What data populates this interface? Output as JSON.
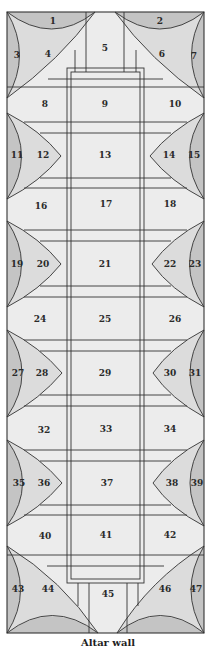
{
  "caption": "Altar wall",
  "colors": {
    "background": "#ececec",
    "light_fill": "#dcdcdc",
    "dark_fill": "#c4c4c4",
    "stroke": "#333333"
  },
  "fields": [
    {
      "n": "1",
      "x": 53,
      "y": 21
    },
    {
      "n": "2",
      "x": 160,
      "y": 21
    },
    {
      "n": "3",
      "x": 17,
      "y": 55
    },
    {
      "n": "4",
      "x": 48,
      "y": 54
    },
    {
      "n": "5",
      "x": 105,
      "y": 48
    },
    {
      "n": "6",
      "x": 162,
      "y": 54
    },
    {
      "n": "7",
      "x": 194,
      "y": 56
    },
    {
      "n": "8",
      "x": 45,
      "y": 104
    },
    {
      "n": "9",
      "x": 105,
      "y": 104
    },
    {
      "n": "10",
      "x": 175,
      "y": 104
    },
    {
      "n": "11",
      "x": 17,
      "y": 155
    },
    {
      "n": "12",
      "x": 43,
      "y": 155
    },
    {
      "n": "13",
      "x": 105,
      "y": 155
    },
    {
      "n": "14",
      "x": 169,
      "y": 155
    },
    {
      "n": "15",
      "x": 194,
      "y": 155
    },
    {
      "n": "16",
      "x": 41,
      "y": 206
    },
    {
      "n": "17",
      "x": 106,
      "y": 204
    },
    {
      "n": "18",
      "x": 170,
      "y": 204
    },
    {
      "n": "19",
      "x": 17,
      "y": 264
    },
    {
      "n": "20",
      "x": 43,
      "y": 264
    },
    {
      "n": "21",
      "x": 105,
      "y": 264
    },
    {
      "n": "22",
      "x": 170,
      "y": 264
    },
    {
      "n": "23",
      "x": 195,
      "y": 264
    },
    {
      "n": "24",
      "x": 40,
      "y": 319
    },
    {
      "n": "25",
      "x": 105,
      "y": 319
    },
    {
      "n": "26",
      "x": 175,
      "y": 319
    },
    {
      "n": "27",
      "x": 18,
      "y": 373
    },
    {
      "n": "28",
      "x": 42,
      "y": 373
    },
    {
      "n": "29",
      "x": 105,
      "y": 373
    },
    {
      "n": "30",
      "x": 170,
      "y": 373
    },
    {
      "n": "31",
      "x": 195,
      "y": 373
    },
    {
      "n": "32",
      "x": 44,
      "y": 430
    },
    {
      "n": "33",
      "x": 106,
      "y": 429
    },
    {
      "n": "34",
      "x": 170,
      "y": 429
    },
    {
      "n": "35",
      "x": 19,
      "y": 483
    },
    {
      "n": "36",
      "x": 44,
      "y": 483
    },
    {
      "n": "37",
      "x": 107,
      "y": 483
    },
    {
      "n": "38",
      "x": 172,
      "y": 483
    },
    {
      "n": "39",
      "x": 197,
      "y": 483
    },
    {
      "n": "40",
      "x": 45,
      "y": 536
    },
    {
      "n": "41",
      "x": 106,
      "y": 535
    },
    {
      "n": "42",
      "x": 170,
      "y": 535
    },
    {
      "n": "43",
      "x": 18,
      "y": 589
    },
    {
      "n": "44",
      "x": 48,
      "y": 589
    },
    {
      "n": "45",
      "x": 108,
      "y": 594
    },
    {
      "n": "46",
      "x": 165,
      "y": 589
    },
    {
      "n": "47",
      "x": 196,
      "y": 589
    }
  ]
}
